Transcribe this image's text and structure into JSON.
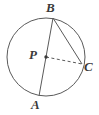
{
  "figure": {
    "background_color": "#ffffff",
    "stroke_color": "#5a5a5a",
    "label_color": "#3a3a3a",
    "labels": {
      "center": "P",
      "top": "B",
      "bottom": "A",
      "right": "C"
    },
    "circle": {
      "center_x": 46,
      "center_y": 57,
      "radius": 39
    },
    "points": {
      "P": {
        "x": 46,
        "y": 57
      },
      "B": {
        "x": 53,
        "y": 18
      },
      "A": {
        "x": 39,
        "y": 96
      },
      "C": {
        "x": 82,
        "y": 64
      }
    },
    "segments": [
      {
        "name": "diameter-AB",
        "from": "B",
        "to": "A",
        "style": "solid"
      },
      {
        "name": "chord-BC",
        "from": "B",
        "to": "C",
        "style": "solid"
      },
      {
        "name": "radius-PC",
        "from": "P",
        "to": "C",
        "style": "dashed"
      }
    ]
  }
}
